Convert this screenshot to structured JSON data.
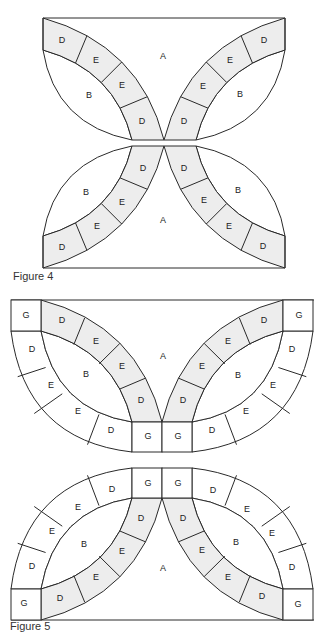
{
  "figures": [
    {
      "caption": "Figure 4",
      "labels": {
        "A": "A",
        "B": "B",
        "D": "D",
        "E": "E"
      },
      "band_sequence": [
        "D",
        "E",
        "E",
        "D"
      ]
    },
    {
      "caption": "Figure 5",
      "labels": {
        "A": "A",
        "B": "B",
        "D": "D",
        "E": "E",
        "G": "G"
      },
      "band_sequence": [
        "D",
        "E",
        "E",
        "D"
      ],
      "outer_band_sequence": [
        "D",
        "E",
        "E",
        "D"
      ],
      "corner_piece": "G"
    }
  ],
  "colors": {
    "shaded_fill": "#ededed",
    "line": "#2a2a2a",
    "background": "#ffffff"
  }
}
